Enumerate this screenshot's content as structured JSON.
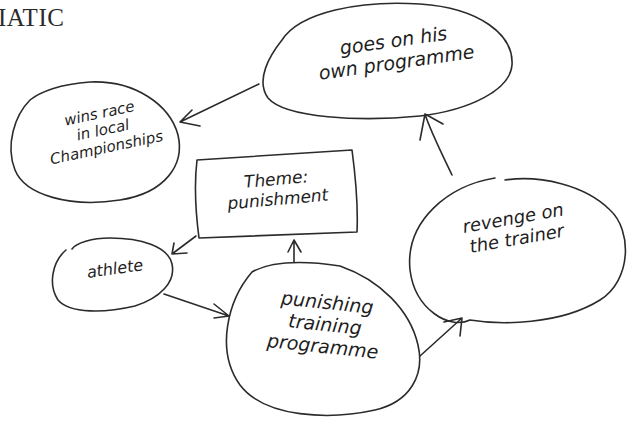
{
  "heading": "IATIC",
  "diagram": {
    "type": "hand-drawn mind map",
    "nodes": [
      {
        "id": "own-programme",
        "label": "goes on his\nown programme",
        "shape": "ellipse"
      },
      {
        "id": "wins-race",
        "label": "wins race\nin local\nChampionships",
        "shape": "ellipse"
      },
      {
        "id": "theme",
        "label": "Theme:\npunishment",
        "shape": "rectangle"
      },
      {
        "id": "athlete",
        "label": "athlete",
        "shape": "ellipse"
      },
      {
        "id": "training",
        "label": "punishing\ntraining\nprogramme",
        "shape": "ellipse"
      },
      {
        "id": "revenge",
        "label": "revenge on\nthe trainer",
        "shape": "ellipse"
      }
    ],
    "edges": [
      {
        "from": "athlete",
        "to": "training"
      },
      {
        "from": "training",
        "to": "theme"
      },
      {
        "from": "theme",
        "to": "athlete"
      },
      {
        "from": "training",
        "to": "revenge"
      },
      {
        "from": "revenge",
        "to": "own-programme"
      },
      {
        "from": "own-programme",
        "to": "wins-race"
      }
    ]
  },
  "colors": {
    "ink": "#2b2b2b",
    "background": "#ffffff"
  }
}
